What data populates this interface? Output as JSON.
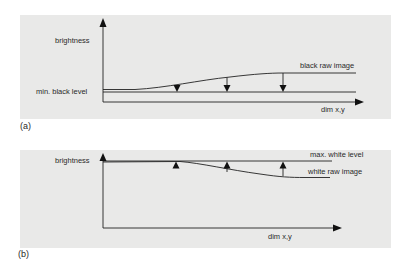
{
  "figure": {
    "panels": [
      {
        "tag": "(a)",
        "y_axis_label": "brightness",
        "x_axis_label": "dim x,y",
        "reference_line_label": "min. black level",
        "curve_label": "black raw image",
        "arrow_direction": "down",
        "arrow_count": 3
      },
      {
        "tag": "(b)",
        "y_axis_label": "brightness",
        "x_axis_label": "dim x,y",
        "reference_line_label": "max. white level",
        "curve_label": "white raw image",
        "arrow_direction": "up",
        "arrow_count": 3
      }
    ],
    "colors": {
      "panel_background": "#e9e9e8",
      "line": "#222222",
      "page_background": "#ffffff"
    }
  }
}
